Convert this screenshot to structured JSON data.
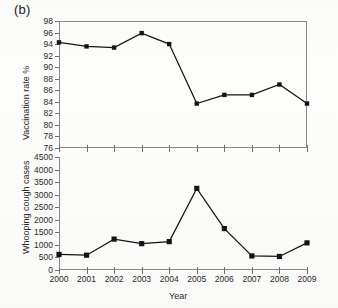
{
  "figure": {
    "panel_label": "(b)",
    "xlabel": "Year"
  },
  "chart_data": [
    {
      "type": "line",
      "title": "",
      "xlabel": "",
      "ylabel": "Vaccination rate %",
      "categories": [
        "2000",
        "2001",
        "2002",
        "2003",
        "2004",
        "2005",
        "2006",
        "2007",
        "2008",
        "2009"
      ],
      "x": [
        2000,
        2001,
        2002,
        2003,
        2004,
        2005,
        2006,
        2007,
        2008,
        2009
      ],
      "values": [
        94.3,
        93.6,
        93.4,
        95.9,
        94.0,
        83.7,
        85.2,
        85.2,
        87.0,
        83.7
      ],
      "ylim": [
        76,
        98
      ],
      "ytick_step": 2,
      "yticks": [
        98,
        96,
        94,
        92,
        90,
        88,
        86,
        84,
        82,
        80,
        78,
        76
      ],
      "grid": false,
      "legend": "none",
      "marker": "square",
      "frame": "box"
    },
    {
      "type": "line",
      "title": "",
      "xlabel": "Year",
      "ylabel": "Whooping cough cases",
      "categories": [
        "2000",
        "2001",
        "2002",
        "2003",
        "2004",
        "2005",
        "2006",
        "2007",
        "2008",
        "2009"
      ],
      "x": [
        2000,
        2001,
        2002,
        2003,
        2004,
        2005,
        2006,
        2007,
        2008,
        2009
      ],
      "values": [
        620,
        590,
        1230,
        1050,
        1130,
        3250,
        1650,
        560,
        540,
        1080
      ],
      "ylim": [
        0,
        4500
      ],
      "ytick_step": 500,
      "yticks": [
        4500,
        4000,
        3500,
        3000,
        2500,
        2000,
        1500,
        1000,
        500,
        0
      ],
      "grid": false,
      "legend": "none",
      "marker": "square",
      "frame": "left-bottom"
    }
  ]
}
